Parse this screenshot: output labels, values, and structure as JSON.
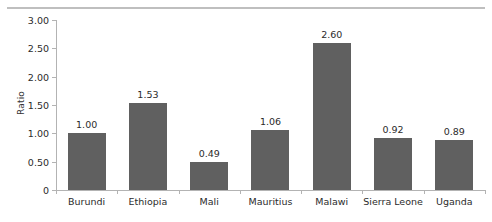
{
  "chart_data": {
    "type": "bar",
    "title": "",
    "subtitle": "",
    "xlabel": "",
    "ylabel": "Ratio",
    "ylim": [
      0,
      3.0
    ],
    "ytick_labels": [
      "3.00",
      "2.50",
      "2.00",
      "1.50",
      "1.00",
      "0.50",
      "0"
    ],
    "ytick_values": [
      3.0,
      2.5,
      2.0,
      1.5,
      1.0,
      0.5,
      0
    ],
    "grid": false,
    "legend": null,
    "bar_color": "#606060",
    "axis_color": "#b3b3b3",
    "text_color": "#2b2b2b",
    "categories": [
      "Burundi",
      "Ethiopia",
      "Mali",
      "Mauritius",
      "Malawi",
      "Sierra Leone",
      "Uganda"
    ],
    "values": [
      1.0,
      1.53,
      0.49,
      1.06,
      2.6,
      0.92,
      0.89
    ],
    "value_labels": [
      "1.00",
      "1.53",
      "0.49",
      "1.06",
      "2.60",
      "0.92",
      "0.89"
    ]
  },
  "decorations": {
    "top_rule_color": "#bfbfbf"
  }
}
